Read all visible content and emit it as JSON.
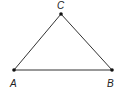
{
  "diagram": {
    "type": "triangle",
    "stroke_color": "#333333",
    "vertices": [
      {
        "name": "A",
        "label": "A",
        "x": 14,
        "y": 70,
        "label_x": 10,
        "label_y": 87
      },
      {
        "name": "B",
        "label": "B",
        "x": 112,
        "y": 70,
        "label_x": 107,
        "label_y": 87
      },
      {
        "name": "C",
        "label": "C",
        "x": 61,
        "y": 14,
        "label_x": 57,
        "label_y": 9
      }
    ],
    "edges": [
      {
        "from": "A",
        "to": "B"
      },
      {
        "from": "B",
        "to": "C"
      },
      {
        "from": "C",
        "to": "A"
      }
    ]
  }
}
